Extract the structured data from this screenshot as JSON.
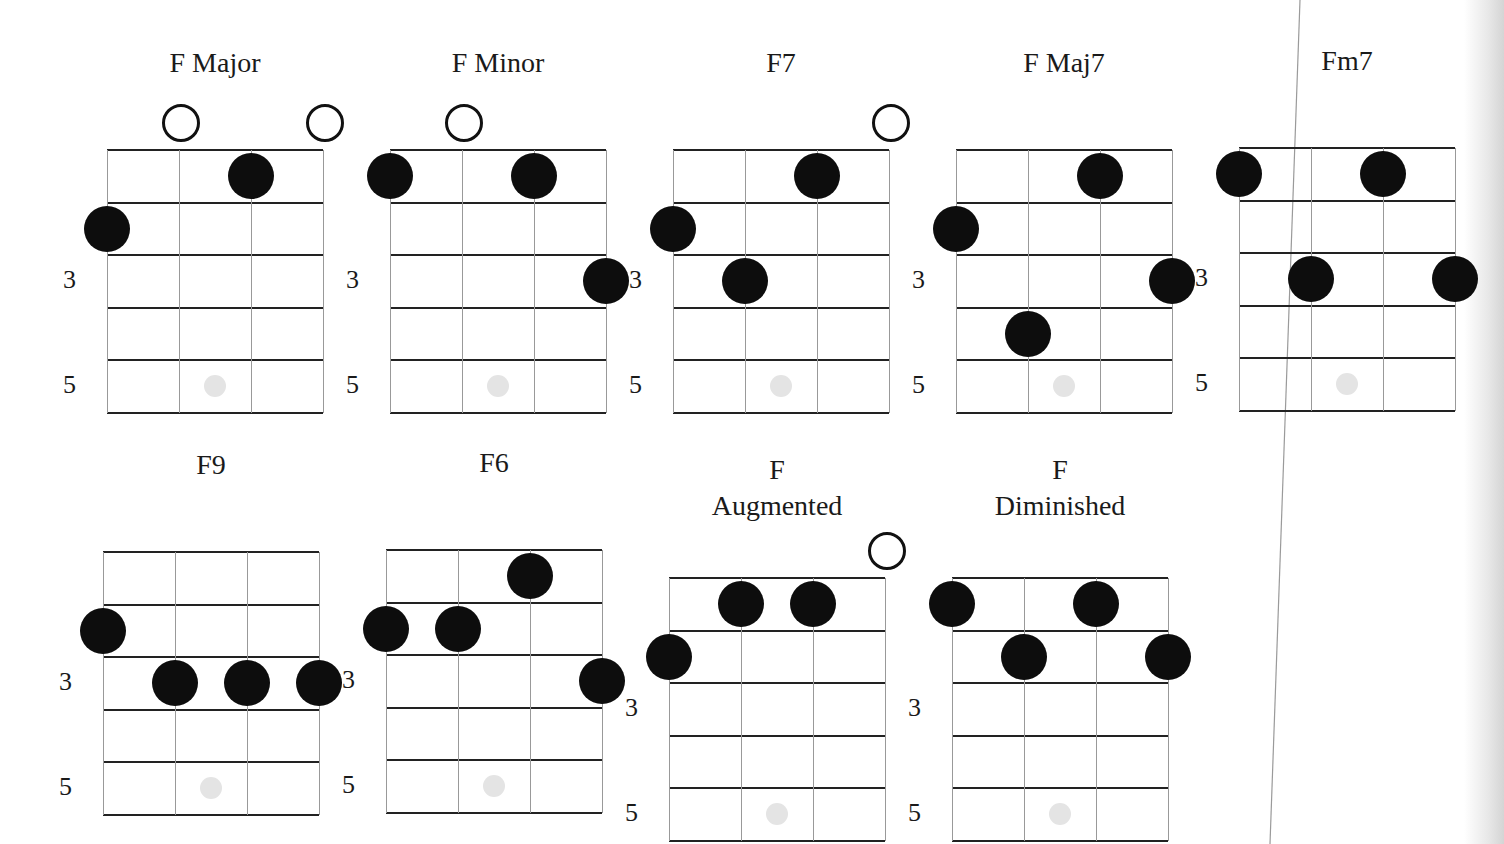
{
  "diagram": {
    "colors": {
      "dot": "#0d0d0d",
      "line": "#222222",
      "marker": "#e4e4e4"
    },
    "fret_labels": [
      "3",
      "5"
    ],
    "chords": [
      {
        "name": "F Major",
        "title_lines": [
          "F Major"
        ],
        "x": 107,
        "y": 150,
        "open": [
          1,
          3
        ],
        "dots": [
          [
            2,
            1
          ],
          [
            0,
            2
          ]
        ]
      },
      {
        "name": "F Minor",
        "title_lines": [
          "F Minor"
        ],
        "x": 390,
        "y": 150,
        "open": [
          1
        ],
        "dots": [
          [
            0,
            1
          ],
          [
            2,
            1
          ],
          [
            3,
            3
          ]
        ]
      },
      {
        "name": "F7",
        "title_lines": [
          "F7"
        ],
        "x": 673,
        "y": 150,
        "open": [
          3
        ],
        "dots": [
          [
            2,
            1
          ],
          [
            0,
            2
          ],
          [
            1,
            3
          ]
        ]
      },
      {
        "name": "F Maj7",
        "title_lines": [
          "F Maj7"
        ],
        "x": 956,
        "y": 150,
        "open": [],
        "dots": [
          [
            2,
            1
          ],
          [
            0,
            2
          ],
          [
            3,
            3
          ],
          [
            1,
            4
          ]
        ]
      },
      {
        "name": "Fm7",
        "title_lines": [
          "Fm7"
        ],
        "x": 1239,
        "y": 148,
        "open": [],
        "dots": [
          [
            0,
            1
          ],
          [
            2,
            1
          ],
          [
            1,
            3
          ],
          [
            3,
            3
          ]
        ]
      },
      {
        "name": "F9",
        "title_lines": [
          "F9"
        ],
        "x": 103,
        "y": 552,
        "open": [],
        "dots": [
          [
            0,
            2
          ],
          [
            1,
            3
          ],
          [
            2,
            3
          ],
          [
            3,
            3
          ]
        ]
      },
      {
        "name": "F6",
        "title_lines": [
          "F6"
        ],
        "x": 386,
        "y": 550,
        "open": [],
        "dots": [
          [
            2,
            1
          ],
          [
            0,
            2
          ],
          [
            1,
            2
          ],
          [
            3,
            3
          ]
        ]
      },
      {
        "name": "F Augmented",
        "title_lines": [
          "F",
          "Augmented"
        ],
        "x": 669,
        "y": 578,
        "open": [
          3
        ],
        "dots": [
          [
            1,
            1
          ],
          [
            2,
            1
          ],
          [
            0,
            2
          ]
        ]
      },
      {
        "name": "F Diminished",
        "title_lines": [
          "F",
          "Diminished"
        ],
        "x": 952,
        "y": 578,
        "open": [],
        "dots": [
          [
            0,
            1
          ],
          [
            2,
            1
          ],
          [
            1,
            2
          ],
          [
            3,
            2
          ]
        ]
      }
    ]
  }
}
